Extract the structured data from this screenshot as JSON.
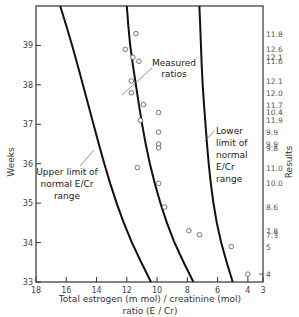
{
  "chart_data": {
    "type": "scatter",
    "title": "",
    "xlabel": "Total estrogen (m mol) / creatinine (mol) ratio (E/Cr)",
    "xlabel_lines": [
      "Total estrogen (m mol) / creatinine  (mol)",
      "ratio (E / Cr)"
    ],
    "ylabel": "Weeks",
    "y2label": "Results",
    "xlim": [
      18,
      3
    ],
    "x_reversed": true,
    "ylim": [
      33,
      40
    ],
    "grid": false,
    "legend": "none",
    "x_ticks": [
      18,
      16,
      14,
      12,
      10,
      8,
      6,
      4,
      3
    ],
    "y_ticks": [
      33,
      34,
      35,
      36,
      37,
      38,
      39
    ],
    "series": [
      {
        "name": "Measured ratios",
        "marker": "open-circle",
        "points": [
          {
            "x": 11.4,
            "y": 39.3,
            "result": "11.8"
          },
          {
            "x": 12.1,
            "y": 38.9,
            "result": "12.6"
          },
          {
            "x": 11.6,
            "y": 38.7,
            "result": "12.1"
          },
          {
            "x": 11.2,
            "y": 38.6,
            "result": "11.6"
          },
          {
            "x": 11.7,
            "y": 38.1,
            "result": "12.1"
          },
          {
            "x": 11.7,
            "y": 37.8,
            "result": "12.0"
          },
          {
            "x": 10.9,
            "y": 37.5,
            "result": "11.7"
          },
          {
            "x": 9.9,
            "y": 37.3,
            "result": "10.4"
          },
          {
            "x": 11.1,
            "y": 37.1,
            "result": "11.9"
          },
          {
            "x": 9.9,
            "y": 36.8,
            "result": "9.9"
          },
          {
            "x": 9.9,
            "y": 36.5,
            "result": "9.9"
          },
          {
            "x": 9.9,
            "y": 36.4,
            "result": "9.8"
          },
          {
            "x": 11.3,
            "y": 35.9,
            "result": "11.0"
          },
          {
            "x": 9.9,
            "y": 35.5,
            "result": "10.0"
          },
          {
            "x": 9.5,
            "y": 34.9,
            "result": "8.6"
          },
          {
            "x": 7.9,
            "y": 34.3,
            "result": "7.8"
          },
          {
            "x": 7.2,
            "y": 34.2,
            "result": "7.3"
          },
          {
            "x": 5.1,
            "y": 33.9,
            "result": "5"
          },
          {
            "x": 4.0,
            "y": 33.2,
            "result": "4"
          }
        ]
      },
      {
        "name": "Upper limit of normal E/Cr range",
        "type": "line",
        "points": [
          {
            "x": 16.4,
            "y": 40.0
          },
          {
            "x": 15.6,
            "y": 39.0
          },
          {
            "x": 14.9,
            "y": 38.0
          },
          {
            "x": 14.2,
            "y": 37.0
          },
          {
            "x": 13.5,
            "y": 36.0
          },
          {
            "x": 12.7,
            "y": 35.0
          },
          {
            "x": 11.7,
            "y": 34.0
          },
          {
            "x": 10.4,
            "y": 33.0
          }
        ]
      },
      {
        "name": "Middle curve",
        "type": "line",
        "points": [
          {
            "x": 12.0,
            "y": 40.0
          },
          {
            "x": 11.8,
            "y": 39.0
          },
          {
            "x": 11.4,
            "y": 38.0
          },
          {
            "x": 11.0,
            "y": 37.0
          },
          {
            "x": 10.5,
            "y": 36.0
          },
          {
            "x": 9.8,
            "y": 35.0
          },
          {
            "x": 8.9,
            "y": 34.0
          },
          {
            "x": 7.6,
            "y": 33.0
          }
        ]
      },
      {
        "name": "Lower limit of normal E/Cr range",
        "type": "line",
        "points": [
          {
            "x": 7.2,
            "y": 40.0
          },
          {
            "x": 7.1,
            "y": 39.0
          },
          {
            "x": 7.0,
            "y": 38.0
          },
          {
            "x": 6.8,
            "y": 37.0
          },
          {
            "x": 6.6,
            "y": 36.0
          },
          {
            "x": 6.3,
            "y": 35.0
          },
          {
            "x": 5.8,
            "y": 34.0
          },
          {
            "x": 5.0,
            "y": 33.0
          }
        ]
      }
    ],
    "annotations": [
      {
        "text_lines": [
          "Measured",
          "ratios"
        ],
        "points_to": "data points"
      },
      {
        "text_lines": [
          "Upper limit of",
          "normal E/Cr",
          "range"
        ],
        "points_to": "left curve"
      },
      {
        "text_lines": [
          "Lower",
          "limit of",
          "normal",
          "E/Cr",
          "range"
        ],
        "points_to": "right curve"
      }
    ],
    "right_axis_results": [
      "11.8",
      "12.6",
      "12.1",
      "11.6",
      "12.1",
      "12.0",
      "11.7",
      "10.4",
      "11.9",
      "9.9",
      "9.9",
      "9.8",
      "11.0",
      "10.0",
      "8.6",
      "7.8",
      "7.3",
      "5",
      "4"
    ]
  }
}
